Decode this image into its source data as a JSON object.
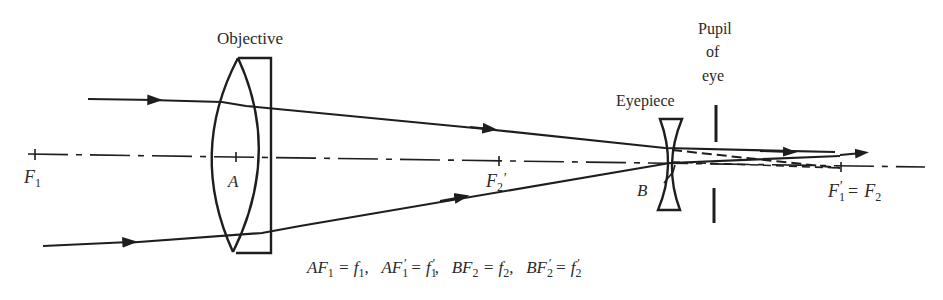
{
  "labels": {
    "objective": "Objective",
    "eyepiece": "Eyepiece",
    "pupil_line1": "Pupil",
    "pupil_line2": "of",
    "pupil_line3": "eye",
    "F1": "F",
    "F1_sub": "1",
    "A": "A",
    "F2prime": "F",
    "F2prime_sub": "2",
    "F2prime_mark": "′",
    "B": "B",
    "F1prime_eq": "F",
    "F1prime_eq_sub": "1",
    "F1prime_eq_mark": "′",
    "eq_sign": "=",
    "F2_eq": "F",
    "F2_eq_sub": "2"
  },
  "caption": {
    "t1": "AF",
    "t1_sub": "1",
    "t1_rest": " = f",
    "t1_rest_sub": "1",
    "sep1": ",   ",
    "t2": "AF",
    "t2_sub": "1",
    "t2_mark": "′",
    "t2_rest": " = f",
    "t2_rest_sub": "1",
    "t2_rest_mark": "′",
    "sep2": ",   ",
    "t3": "BF",
    "t3_sub": "2",
    "t3_rest": " = f",
    "t3_rest_sub": "2",
    "sep3": ",   ",
    "t4": "BF",
    "t4_sub": "2",
    "t4_mark": "′",
    "t4_rest": " = f",
    "t4_rest_sub": "2",
    "t4_rest_mark": "′"
  }
}
